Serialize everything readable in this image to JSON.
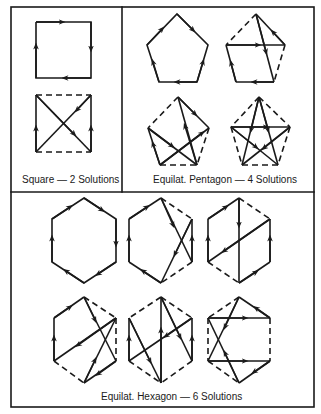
{
  "captions": {
    "square": "Square — 2 Solutions",
    "pentagon": "Equilat. Pentagon — 4 Solutions",
    "hexagon": "Equilat. Hexagon — 6 Solutions"
  },
  "colors": {
    "ink": "#1a1a1a",
    "paper": "#ffffff"
  },
  "panels": [
    {
      "name": "square",
      "solutions": 2
    },
    {
      "name": "pentagon",
      "solutions": 4
    },
    {
      "name": "hexagon",
      "solutions": 6
    }
  ]
}
